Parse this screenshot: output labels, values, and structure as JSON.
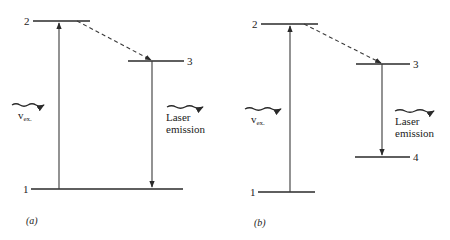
{
  "diagram": {
    "type": "energy-level-diagram",
    "panels": [
      {
        "caption": "(a)",
        "levels": [
          {
            "label": "1",
            "name": "ground"
          },
          {
            "label": "2",
            "name": "pump"
          },
          {
            "label": "3",
            "name": "upper-laser"
          }
        ],
        "excitation": {
          "symbol": "v",
          "subscript": "ex."
        },
        "emission": {
          "line1": "Laser",
          "line2": "emission"
        },
        "transitions": [
          "1→2 absorption (solid)",
          "2→3 non-radiative (dashed)",
          "3→1 laser emission (solid)"
        ]
      },
      {
        "caption": "(b)",
        "levels": [
          {
            "label": "1",
            "name": "ground"
          },
          {
            "label": "2",
            "name": "pump"
          },
          {
            "label": "3",
            "name": "upper-laser"
          },
          {
            "label": "4",
            "name": "lower-laser"
          }
        ],
        "excitation": {
          "symbol": "v",
          "subscript": "ex."
        },
        "emission": {
          "line1": "Laser",
          "line2": "emission"
        },
        "transitions": [
          "1→2 absorption (solid)",
          "2→3 non-radiative (dashed)",
          "3→4 laser emission (solid)"
        ]
      }
    ]
  }
}
